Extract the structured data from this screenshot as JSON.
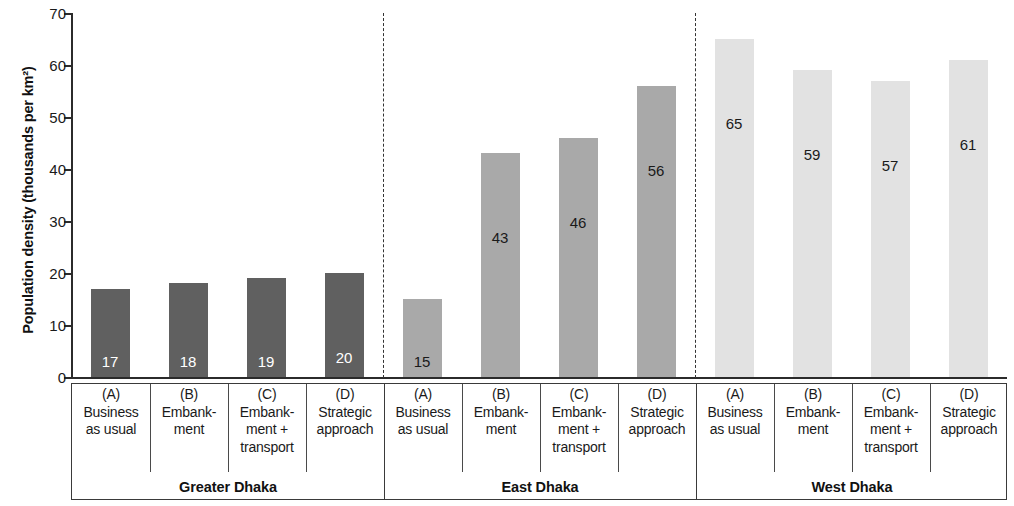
{
  "chart_data": {
    "type": "bar",
    "title": "",
    "xlabel": "",
    "ylabel": "Population density (thousands per km²)",
    "ylim": [
      0,
      70
    ],
    "yticks": [
      0,
      10,
      20,
      30,
      40,
      50,
      60,
      70
    ],
    "grid": false,
    "legend": "none",
    "categories": [
      "(A) Business as usual",
      "(B) Embankment",
      "(C) Embankment + transport",
      "(D) Strategic approach"
    ],
    "series": [
      {
        "name": "Greater Dhaka",
        "values": [
          17,
          18,
          19,
          20
        ],
        "color": "#606060",
        "label_color": "#ffffff"
      },
      {
        "name": "East Dhaka",
        "values": [
          15,
          43,
          46,
          56
        ],
        "color": "#a9a9a9",
        "label_color": "#1a1a1a"
      },
      {
        "name": "West Dhaka",
        "values": [
          65,
          59,
          57,
          61
        ],
        "color": "#e2e2e2",
        "label_color": "#1a1a1a"
      }
    ]
  },
  "axis": {
    "y_title": "Population density (thousands per km²)",
    "tick_labels": [
      "70",
      "60",
      "50",
      "40",
      "30",
      "20",
      "10",
      "0"
    ]
  },
  "groups": [
    {
      "name": "Greater Dhaka",
      "bars": [
        {
          "letter": "(A)",
          "name": "Business\nas usual",
          "value": 17,
          "label": "17"
        },
        {
          "letter": "(B)",
          "name": "Embank-\nment",
          "value": 18,
          "label": "18"
        },
        {
          "letter": "(C)",
          "name": "Embank-\nment +\ntransport",
          "value": 19,
          "label": "19"
        },
        {
          "letter": "(D)",
          "name": "Strategic\napproach",
          "value": 20,
          "label": "20"
        }
      ]
    },
    {
      "name": "East Dhaka",
      "bars": [
        {
          "letter": "(A)",
          "name": "Business\nas usual",
          "value": 15,
          "label": "15"
        },
        {
          "letter": "(B)",
          "name": "Embank-\nment",
          "value": 43,
          "label": "43"
        },
        {
          "letter": "(C)",
          "name": "Embank-\nment +\ntransport",
          "value": 46,
          "label": "46"
        },
        {
          "letter": "(D)",
          "name": "Strategic\napproach",
          "value": 56,
          "label": "56"
        }
      ]
    },
    {
      "name": "West Dhaka",
      "bars": [
        {
          "letter": "(A)",
          "name": "Business\nas usual",
          "value": 65,
          "label": "65"
        },
        {
          "letter": "(B)",
          "name": "Embank-\nment",
          "value": 59,
          "label": "59"
        },
        {
          "letter": "(C)",
          "name": "Embank-\nment +\ntransport",
          "value": 57,
          "label": "57"
        },
        {
          "letter": "(D)",
          "name": "Strategic\napproach",
          "value": 61,
          "label": "61"
        }
      ]
    }
  ],
  "colors": {
    "group_1_bar": "#606060",
    "group_2_bar": "#a9a9a9",
    "group_3_bar": "#e2e2e2",
    "axis": "#2b2b2b",
    "text": "#1a1a1a"
  }
}
